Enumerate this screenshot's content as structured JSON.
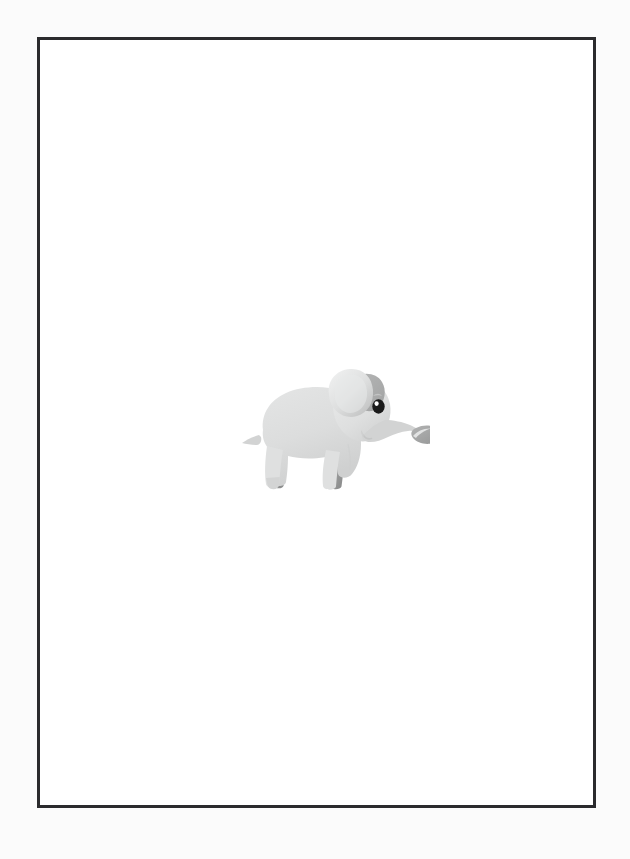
{
  "document": {
    "title": "Baby Elephant Illustration",
    "page_background": "#ffffff",
    "outer_background": "#fbfbfb",
    "width": 630,
    "height": 859
  },
  "frame": {
    "name": "page-border",
    "color": "#2b2b2d",
    "thickness_px": 3,
    "left": 37,
    "top": 37,
    "width": 559,
    "height": 771
  },
  "illustration": {
    "subject": "baby elephant",
    "style": "flat cartoon clip art",
    "facing": "right",
    "alt_text": "A small cartoon baby elephant standing in profile facing right with a curled trunk",
    "position": {
      "left": 190,
      "top": 318,
      "width": 200,
      "height": 145
    },
    "colors": {
      "body_light": "#dfe0e0",
      "body_mid": "#d2d3d3",
      "body_shadow": "#c4c5c5",
      "accent_dark": "#9b9c9c",
      "accent_darker": "#8d8e8e",
      "ear_inner": "#e6e7e7",
      "ear_edge": "#b9baba",
      "trunk_tip": "#9b9c9c",
      "eye": "#1a1a1a",
      "eye_highlight": "#ffffff",
      "outline_soft": "#cacbcb"
    },
    "parts": [
      {
        "name": "body",
        "label": "Body"
      },
      {
        "name": "head",
        "label": "Head"
      },
      {
        "name": "ear",
        "label": "Ear"
      },
      {
        "name": "eye",
        "label": "Eye"
      },
      {
        "name": "trunk",
        "label": "Trunk"
      },
      {
        "name": "trunk-tip",
        "label": "Trunk tip"
      },
      {
        "name": "front-leg-near",
        "label": "Front leg (near)"
      },
      {
        "name": "front-leg-far",
        "label": "Front leg (far)"
      },
      {
        "name": "hind-leg-near",
        "label": "Hind leg (near)"
      },
      {
        "name": "hind-leg-far",
        "label": "Hind leg (far)"
      },
      {
        "name": "tail",
        "label": "Tail"
      },
      {
        "name": "mouth",
        "label": "Mouth"
      }
    ]
  }
}
